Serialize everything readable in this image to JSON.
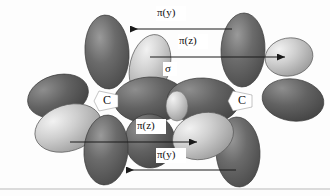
{
  "figure": {
    "type": "orbital-diagram",
    "background_color": "#fdfdfd",
    "line_color": "#b9b9b9"
  },
  "atoms": [
    {
      "label": "C",
      "x": 108,
      "y": 100
    },
    {
      "label": "C",
      "x": 243,
      "y": 100
    }
  ],
  "annotations": [
    {
      "name": "pi-y-top",
      "text": "π(y)",
      "prefix": "π(",
      "variable": "y",
      "suffix": ")",
      "x": 163,
      "y": 14
    },
    {
      "name": "pi-z-top",
      "text": "π(z)",
      "prefix": "π(",
      "variable": "z",
      "suffix": ")",
      "x": 185,
      "y": 42
    },
    {
      "name": "sigma",
      "text": "σ",
      "prefix": "σ",
      "variable": "",
      "suffix": "",
      "x": 168,
      "y": 70
    },
    {
      "name": "pi-z-bottom",
      "text": "π(z)",
      "prefix": "π(",
      "variable": "z",
      "suffix": ")",
      "x": 143,
      "y": 127
    },
    {
      "name": "pi-y-bottom",
      "text": "π(y)",
      "prefix": "π(",
      "variable": "y",
      "suffix": ")",
      "x": 163,
      "y": 156
    }
  ],
  "arrows": [
    {
      "name": "arrow-pi-y-top",
      "from_x": 232,
      "from_y": 29,
      "to_x": 126,
      "to_y": 29,
      "head": "left"
    },
    {
      "name": "arrow-pi-z-top",
      "from_x": 150,
      "from_y": 57,
      "to_x": 289,
      "to_y": 57,
      "head": "right"
    },
    {
      "name": "arrow-pi-z-bottom",
      "from_x": 70,
      "from_y": 142,
      "to_x": 200,
      "to_y": 142,
      "head": "right"
    },
    {
      "name": "arrow-pi-y-bottom",
      "from_x": 236,
      "from_y": 170,
      "to_x": 122,
      "to_y": 170,
      "head": "left"
    }
  ],
  "lobes": [
    {
      "name": "lobe-pi-y-top-left",
      "shade": "dark",
      "cx": 107,
      "cy": 52,
      "rx": 22,
      "ry": 37,
      "rot": -4
    },
    {
      "name": "lobe-pi-y-top-right",
      "shade": "dark",
      "cx": 243,
      "cy": 50,
      "rx": 22,
      "ry": 37,
      "rot": 2
    },
    {
      "name": "lobe-pi-z-top-left",
      "shade": "light",
      "cx": 150,
      "cy": 67,
      "rx": 20,
      "ry": 31,
      "rot": 12
    },
    {
      "name": "lobe-pi-z-top-right",
      "shade": "light",
      "cx": 288,
      "cy": 57,
      "rx": 23,
      "ry": 19,
      "rot": -8
    },
    {
      "name": "lobe-sigma-left",
      "shade": "dark",
      "cx": 152,
      "cy": 100,
      "rx": 34,
      "ry": 22,
      "rot": 0
    },
    {
      "name": "lobe-sigma-right",
      "shade": "dark",
      "cx": 200,
      "cy": 101,
      "rx": 34,
      "ry": 22,
      "rot": 0
    },
    {
      "name": "lobe-sigma-overlap",
      "shade": "light",
      "cx": 177,
      "cy": 105,
      "rx": 11,
      "ry": 14,
      "rot": 0
    },
    {
      "name": "lobe-pi-y-left-outer",
      "shade": "dark",
      "cx": 60,
      "cy": 97,
      "rx": 30,
      "ry": 20,
      "rot": -14
    },
    {
      "name": "lobe-pi-y-right-outer",
      "shade": "dark",
      "cx": 292,
      "cy": 100,
      "rx": 30,
      "ry": 20,
      "rot": 8
    },
    {
      "name": "lobe-pi-z-bottom-left",
      "shade": "light",
      "cx": 70,
      "cy": 127,
      "rx": 33,
      "ry": 22,
      "rot": -16
    },
    {
      "name": "lobe-pi-z-bottom-right",
      "shade": "light",
      "cx": 203,
      "cy": 135,
      "rx": 30,
      "ry": 22,
      "rot": -14
    },
    {
      "name": "lobe-pi-y-bottom-left",
      "shade": "dark",
      "cx": 106,
      "cy": 150,
      "rx": 22,
      "ry": 35,
      "rot": 4
    },
    {
      "name": "lobe-pi-y-bottom-right",
      "shade": "dark",
      "cx": 238,
      "cy": 152,
      "rx": 22,
      "ry": 35,
      "rot": -3
    },
    {
      "name": "lobe-pi-z-bottom-mid",
      "shade": "dark",
      "cx": 152,
      "cy": 140,
      "rx": 24,
      "ry": 26,
      "rot": 0
    }
  ],
  "colors": {
    "dark_lobe": "#5c5c5c",
    "dark_lobe_highlight": "#8b8b8b",
    "light_lobe": "#c6c6c6",
    "light_lobe_highlight": "#ececec",
    "outline": "#3a3a3a",
    "arrow": "#1a1a1a",
    "text": "#111111"
  },
  "baseline": {
    "name": "bottom-rule",
    "y": 189
  }
}
